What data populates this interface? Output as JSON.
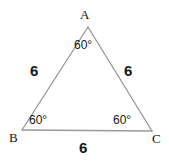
{
  "figure": {
    "type": "geometry-diagram",
    "shape": "equilateral-triangle",
    "stroke_color": "#8a8a8a",
    "text_color": "#151515",
    "background_color": "#ffffff"
  },
  "vertices": [
    {
      "id": "A",
      "label": "A",
      "x": 88,
      "y": 27
    },
    {
      "id": "B",
      "label": "B",
      "x": 22,
      "y": 130
    },
    {
      "id": "C",
      "label": "C",
      "x": 152,
      "y": 131
    }
  ],
  "angles": [
    {
      "at": "A",
      "label": "60°"
    },
    {
      "at": "B",
      "label": "60°"
    },
    {
      "at": "C",
      "label": "60°"
    }
  ],
  "sides": [
    {
      "id": "AB",
      "label": "6"
    },
    {
      "id": "AC",
      "label": "6"
    },
    {
      "id": "BC",
      "label": "6"
    }
  ]
}
